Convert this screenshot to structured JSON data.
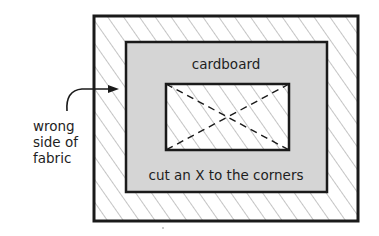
{
  "diagram": {
    "labels": {
      "cardboard": "cardboard",
      "instruction": "cut an X to the corners",
      "fabric_line1": "wrong",
      "fabric_line2": "side of",
      "fabric_line3": "fabric"
    },
    "colors": {
      "outline": "#1a1a1a",
      "cardboard_fill": "#d5d5d5",
      "fabric_fill": "#ffffff",
      "hatch": "#c4c4c4",
      "text": "#1e1e1e"
    }
  }
}
